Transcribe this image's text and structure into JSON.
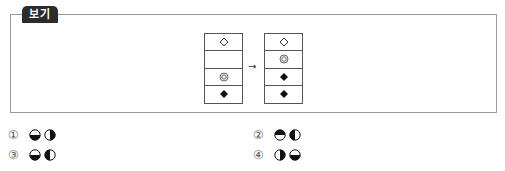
{
  "bogi": {
    "label": "보기",
    "arrow": "→",
    "before_column": [
      "diamond-outline",
      "circle-outline",
      "double-circle",
      "diamond-filled"
    ],
    "after_column": [
      "diamond-outline",
      "double-circle",
      "diamond-filled",
      "diamond-filled"
    ]
  },
  "options": [
    {
      "number": "①",
      "glyphs": [
        "half-bottom-filled-circle",
        "half-right-filled-circle"
      ]
    },
    {
      "number": "②",
      "glyphs": [
        "half-top-filled-circle",
        "half-left-filled-circle"
      ]
    },
    {
      "number": "③",
      "glyphs": [
        "half-bottom-filled-circle",
        "half-left-filled-circle"
      ]
    },
    {
      "number": "④",
      "glyphs": [
        "half-right-filled-circle",
        "half-bottom-filled-circle"
      ]
    }
  ]
}
